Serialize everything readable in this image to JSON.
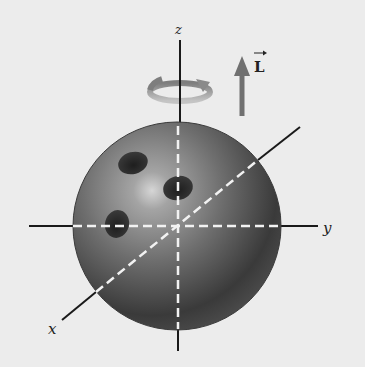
{
  "figure": {
    "axes": {
      "x_label": "x",
      "y_label": "y",
      "z_label": "z"
    },
    "vector_label": "L",
    "colors": {
      "background": "#ececec",
      "ball_light": "#a8a8a8",
      "ball_mid": "#6a6a6a",
      "ball_dark": "#2e2e2e",
      "axis": "#1a1a1a",
      "axis_hidden_dash": "#f2f2f2",
      "rotation_arrow": "#9a9a9a",
      "L_arrow": "#707070"
    }
  }
}
